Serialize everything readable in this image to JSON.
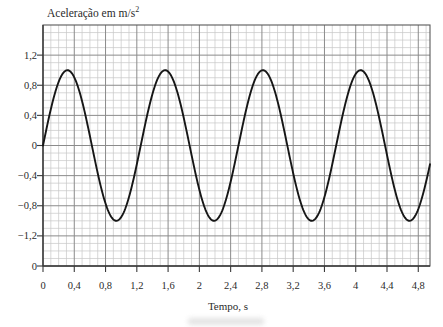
{
  "chart": {
    "title_text": "Aceleração em m/s",
    "title_sup": "2",
    "xlabel": "Tempo, s"
  },
  "colors": {
    "background": "#ffffff",
    "curve": "#161616",
    "major_grid": "#8b8b8b",
    "minor_grid": "#c7c7c7",
    "frame": "#5a5a5a",
    "text": "#2b2b2b"
  },
  "chart_data": {
    "type": "line",
    "xlabel": "Tempo, s",
    "ylabel": "Aceleração em m/s²",
    "grid": "on",
    "series": [
      {
        "name": "aceleração",
        "function": "a(t) = 1.0 · sin(2π·t / 1.25) m/s²",
        "amplitude": 1.0,
        "period_s": 1.25,
        "phase_rad": 0,
        "peaks_t": [
          0.31,
          1.56,
          2.81,
          4.06
        ],
        "peak_value": 1.0,
        "troughs_t": [
          0.94,
          2.19,
          3.44,
          4.69
        ],
        "trough_value": -1.0,
        "zero_crossings_t": [
          0,
          0.625,
          1.25,
          1.875,
          2.5,
          3.125,
          3.75,
          4.375
        ]
      }
    ],
    "x_axis": {
      "min": 0,
      "max": 4.95,
      "major_step": 0.4,
      "minor_step": 0.1,
      "ticks": [
        {
          "label": "0",
          "value": 0
        },
        {
          "label": "0,4",
          "value": 0.4
        },
        {
          "label": "0,8",
          "value": 0.8
        },
        {
          "label": "1,2",
          "value": 1.2
        },
        {
          "label": "1,6",
          "value": 1.6
        },
        {
          "label": "2",
          "value": 2.0
        },
        {
          "label": "2,4",
          "value": 2.4
        },
        {
          "label": "2,8",
          "value": 2.8
        },
        {
          "label": "3,2",
          "value": 3.2
        },
        {
          "label": "3,6",
          "value": 3.6
        },
        {
          "label": "4",
          "value": 4.0
        },
        {
          "label": "4,4",
          "value": 4.4
        },
        {
          "label": "4,8",
          "value": 4.8
        }
      ]
    },
    "y_axis": {
      "min": -1.6,
      "max": 1.6,
      "major_step": 0.4,
      "minor_step": 0.1,
      "ticks": [
        {
          "label": "1,2",
          "value": 1.2
        },
        {
          "label": "0,8",
          "value": 0.8
        },
        {
          "label": "0,4",
          "value": 0.4
        },
        {
          "label": "0",
          "value": 0
        },
        {
          "label": "−0,4",
          "value": -0.4
        },
        {
          "label": "−0,8",
          "value": -0.8
        },
        {
          "label": "−1,2",
          "value": -1.2
        },
        {
          "label": "0",
          "value": -1.6
        }
      ]
    }
  }
}
